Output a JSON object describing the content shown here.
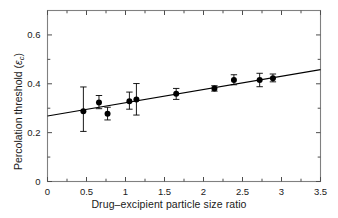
{
  "chart_data": {
    "type": "scatter",
    "title": "",
    "xlabel": "Drug–excipient particle size ratio",
    "ylabel": "Percolation threshold (εc)",
    "ylabel_main": "Percolation threshold (",
    "ylabel_symbol": "ε",
    "ylabel_subscript": "c",
    "ylabel_close": ")",
    "xlim": [
      0,
      3.5
    ],
    "ylim": [
      0,
      0.7
    ],
    "xticks": [
      0,
      0.5,
      1,
      1.5,
      2,
      2.5,
      3,
      3.5
    ],
    "xtick_labels": [
      "0",
      "0.5",
      "1",
      "1.5",
      "2",
      "2.5",
      "3",
      "3.5"
    ],
    "yticks": [
      0,
      0.2,
      0.4,
      0.6
    ],
    "ytick_labels": [
      "0",
      "0.2",
      "0.4",
      "0.6"
    ],
    "y_minor_ticks": [
      0.1,
      0.3,
      0.5
    ],
    "x_minor_ticks": [
      0.25,
      0.75,
      1.25,
      1.75,
      2.25,
      2.75,
      3.25
    ],
    "grid": false,
    "legend": null,
    "marker": "filled-circle",
    "marker_color": "#000000",
    "line_color": "#000000",
    "frame_color": "#808080",
    "points": [
      {
        "x": 0.46,
        "y": 0.288,
        "yerr_low": 0.205,
        "yerr_high": 0.387
      },
      {
        "x": 0.66,
        "y": 0.323,
        "yerr_low": 0.298,
        "yerr_high": 0.352
      },
      {
        "x": 0.77,
        "y": 0.277,
        "yerr_low": 0.252,
        "yerr_high": 0.304
      },
      {
        "x": 1.05,
        "y": 0.329,
        "yerr_low": 0.296,
        "yerr_high": 0.366
      },
      {
        "x": 1.14,
        "y": 0.336,
        "yerr_low": 0.272,
        "yerr_high": 0.401
      },
      {
        "x": 1.65,
        "y": 0.359,
        "yerr_low": 0.336,
        "yerr_high": 0.381
      },
      {
        "x": 2.14,
        "y": 0.381,
        "yerr_low": 0.37,
        "yerr_high": 0.392
      },
      {
        "x": 2.39,
        "y": 0.416,
        "yerr_low": 0.396,
        "yerr_high": 0.437
      },
      {
        "x": 2.72,
        "y": 0.415,
        "yerr_low": 0.388,
        "yerr_high": 0.443
      },
      {
        "x": 2.89,
        "y": 0.423,
        "yerr_low": 0.408,
        "yerr_high": 0.44
      }
    ],
    "fit_line": {
      "x0": 0.0,
      "y0": 0.268,
      "x1": 3.5,
      "y1": 0.458,
      "slope": 0.0543,
      "intercept": 0.268
    }
  }
}
